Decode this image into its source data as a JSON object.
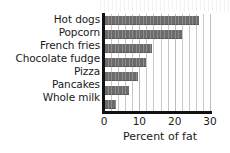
{
  "chart_data": {
    "type": "bar",
    "orientation": "horizontal",
    "title": "",
    "xlabel": "Percent of fat",
    "ylabel": "",
    "categories": [
      "Hot dogs",
      "Popcorn",
      "French fries",
      "Chocolate fudge",
      "Pizza",
      "Pancakes",
      "Whole milk"
    ],
    "values": [
      27,
      22,
      13.5,
      12,
      9.5,
      7,
      3.5
    ],
    "xlim": [
      0,
      30
    ],
    "xticks": [
      0,
      10,
      20,
      30
    ],
    "xtick_labels": [
      "0",
      "10",
      "20",
      "30"
    ],
    "grid": "vertical-minor-every-2-units",
    "legend": "none",
    "bar_color": "#6b6b6b",
    "axis_color": "#111111",
    "gridline_color": "#c8c8c8",
    "background_color": "#ffffff"
  }
}
